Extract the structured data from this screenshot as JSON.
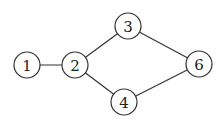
{
  "graph": {
    "nodes": [
      {
        "id": "1",
        "label": "1",
        "x": 27,
        "y": 65,
        "r": 13
      },
      {
        "id": "2",
        "label": "2",
        "x": 75,
        "y": 65,
        "r": 13
      },
      {
        "id": "3",
        "label": "3",
        "x": 128,
        "y": 26,
        "r": 13
      },
      {
        "id": "4",
        "label": "4",
        "x": 124,
        "y": 102,
        "r": 13
      },
      {
        "id": "6",
        "label": "6",
        "x": 199,
        "y": 64,
        "r": 13
      }
    ],
    "edges": [
      {
        "from": "1",
        "to": "2"
      },
      {
        "from": "2",
        "to": "3"
      },
      {
        "from": "2",
        "to": "4"
      },
      {
        "from": "3",
        "to": "6"
      },
      {
        "from": "4",
        "to": "6"
      }
    ]
  }
}
